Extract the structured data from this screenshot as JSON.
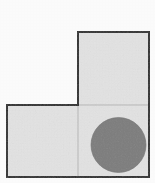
{
  "figure": {
    "name": "L-shaped polyomino with inscribed circle",
    "canvas": {
      "width": 155,
      "height": 183,
      "background_color": "#fdfdfd"
    },
    "style": {
      "outline_color": "#2b2b2b",
      "outline_width": 2,
      "cell_fill_color": "#e4e4e4",
      "divider_color": "#b9b9b9",
      "divider_width": 1,
      "circle_fill_color": "#7d7d7d",
      "circle_stroke_color": "#6f6f6f"
    },
    "outline_path": "M 78 32 L 149 32 L 149 177 L 7 177 L 7 105 L 78 105 Z",
    "cells": [
      {
        "id": "cell-top-right",
        "label": "top square",
        "x": 78,
        "y": 32,
        "width": 71,
        "height": 73
      },
      {
        "id": "cell-bottom-left",
        "label": "bottom-left square",
        "x": 7,
        "y": 105,
        "width": 71,
        "height": 72
      },
      {
        "id": "cell-bottom-right",
        "label": "bottom-right square",
        "x": 78,
        "y": 105,
        "width": 71,
        "height": 72
      }
    ],
    "dividers": [
      {
        "id": "divider-vertical",
        "orientation": "vertical",
        "x1": 78,
        "y1": 105,
        "x2": 78,
        "y2": 177
      },
      {
        "id": "divider-horizontal",
        "orientation": "horizontal",
        "x1": 78,
        "y1": 105,
        "x2": 149,
        "y2": 105
      }
    ],
    "circle": {
      "id": "shaded-circle",
      "label": "shaded circle",
      "cx": 118.5,
      "cy": 145,
      "r": 27.5,
      "contained_in": "cell-bottom-right"
    }
  }
}
